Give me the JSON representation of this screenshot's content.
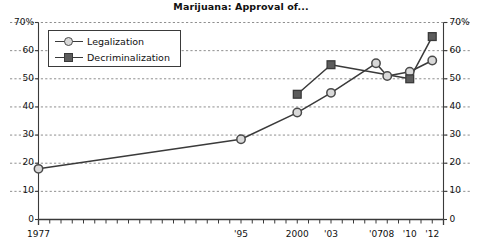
{
  "chart_data": {
    "type": "line",
    "title": "Marijuana: Approval of...",
    "xlabel": "",
    "ylabel": "",
    "ylim": [
      0,
      70
    ],
    "xlim": [
      1977,
      2013
    ],
    "grid": true,
    "y_ticks": [
      0,
      10,
      20,
      30,
      40,
      50,
      60,
      70
    ],
    "y_tick_labels_left": [
      "0",
      "10",
      "20",
      "30",
      "40",
      "50",
      "60",
      "70%"
    ],
    "y_tick_labels_right": [
      "0",
      "10",
      "20",
      "30",
      "40",
      "50",
      "60",
      "70%"
    ],
    "dual_axis": true,
    "x_tick_labels": [
      "1977",
      "'95",
      "2000",
      "'03",
      "'07",
      "'08",
      "'10",
      "'12"
    ],
    "x_tick_values": [
      1977,
      1995,
      2000,
      2003,
      2007,
      2008,
      2010,
      2012
    ],
    "x_minor_tick_step": 1,
    "legend_position": "upper-left",
    "series": [
      {
        "name": "Legalization",
        "marker": "circle",
        "x": [
          1977,
          1995,
          2000,
          2003,
          2007,
          2008,
          2010,
          2012
        ],
        "values": [
          18,
          28.5,
          38,
          45,
          55.5,
          51,
          52.5,
          56.5
        ]
      },
      {
        "name": "Decriminalization",
        "marker": "square",
        "x": [
          2000,
          2003,
          2010,
          2012
        ],
        "values": [
          44.5,
          55,
          50,
          65
        ]
      }
    ],
    "colors": {
      "line": "#3a3a3a",
      "circle_fill": "#d9d9d9",
      "circle_edge": "#4a4a4a",
      "square_fill": "#5c5c5c",
      "square_edge": "#3a3a3a",
      "grid": "#8f8f8f",
      "axis": "#3a3a3a",
      "background": "#ffffff",
      "text": "#111111"
    }
  }
}
